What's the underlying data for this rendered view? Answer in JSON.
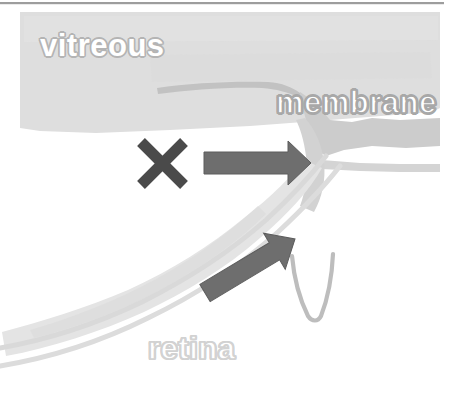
{
  "figure": {
    "width": 458,
    "height": 394,
    "background": "#ffffff",
    "top_rule_color": "#8c8c8c"
  },
  "labels": {
    "vitreous": "vitreous",
    "membrane": "membrane",
    "retina": "retina"
  },
  "annotations": {
    "cross_mark": {
      "name": "x-mark",
      "meaning": "traction blocked",
      "color": "#4a4a4a",
      "center_x": 162,
      "center_y": 163,
      "size": 44,
      "stroke_width": 11
    },
    "arrow_horizontal": {
      "name": "horizontal-traction-arrow",
      "direction": "right",
      "color": "#6e6e6e",
      "tail_x": 204,
      "tip_x": 311,
      "y": 163
    },
    "arrow_diagonal": {
      "name": "diagonal-traction-arrow",
      "direction": "up-right",
      "color": "#6e6e6e",
      "tail_x": 205,
      "tail_y": 293,
      "tip_x": 305,
      "tip_y": 232,
      "angle_degrees": -31
    },
    "v_stroke": {
      "name": "v-shaped-fold",
      "color": "#bcbcbc",
      "stroke_width": 4
    }
  },
  "anatomy": {
    "vitreous_body": {
      "name": "vitreous-region",
      "fill": "#dddddd",
      "description": "light gray band across upper area sloping down to the right"
    },
    "membrane_band": {
      "name": "membrane-region",
      "fill": "#c9c9c9",
      "stroke_fill": "#c0c0c0",
      "description": "gray band overlying retina surface extending to right edge"
    },
    "retina_layer": {
      "name": "retina-region",
      "fill": "#e2e2e2",
      "description": "curved retinal band sweeping from lower left to upper right"
    },
    "retina_lines": {
      "name": "retina-boundary-lines",
      "stroke": "#d8d8d8",
      "stroke_width": 5,
      "count": 2
    }
  },
  "colors": {
    "white": "#ffffff",
    "vitreous_gray": "#dddddd",
    "membrane_gray": "#c9c9c9",
    "retina_gray": "#e2e2e2",
    "arrow_gray": "#6e6e6e",
    "cross_gray": "#4a4a4a",
    "outline_gray": "#b4b4b4"
  }
}
